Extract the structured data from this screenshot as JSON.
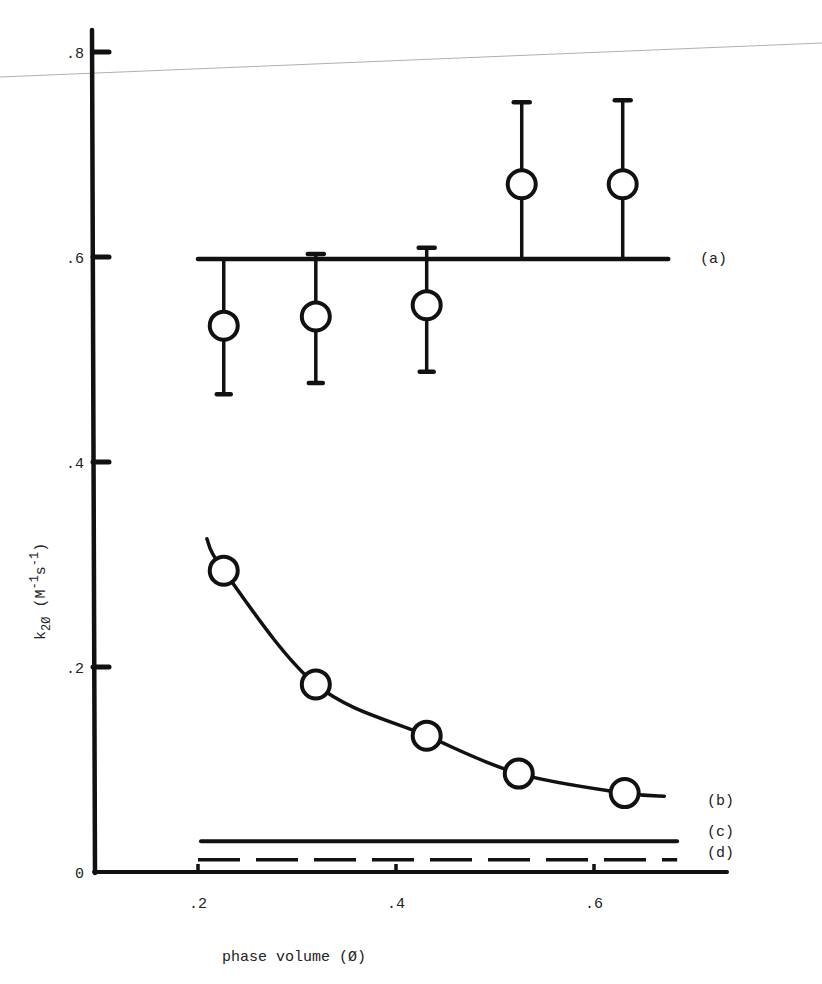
{
  "chart_data": {
    "type": "scatter",
    "title": "",
    "xlabel": "phase volume (Ø)",
    "ylabel": "k2Ø (M-1s-1)",
    "ylabel_parts": {
      "main": "k",
      "sub": "2Ø",
      "units_open": " (M",
      "sup1": "-1",
      "s": "s",
      "sup2": "-1",
      "units_close": ")"
    },
    "xlim": [
      0.1,
      0.73
    ],
    "ylim": [
      0,
      0.82
    ],
    "x_ticks": [
      0.2,
      0.4,
      0.6
    ],
    "x_tick_labels": [
      ".2",
      ".4",
      ".6"
    ],
    "y_ticks": [
      0,
      0.2,
      0.4,
      0.6,
      0.8
    ],
    "y_tick_labels": [
      "0",
      ".2",
      ".4",
      ".6",
      ".8"
    ],
    "grid": false,
    "legend_position": "right, inline labels",
    "series": [
      {
        "name": "(a)",
        "kind": "points_with_error_bars_and_horizontal_line",
        "x": [
          0.226,
          0.319,
          0.431,
          0.527,
          0.629
        ],
        "y": [
          0.533,
          0.542,
          0.553,
          0.671,
          0.671
        ],
        "y_err_upper": [
          0.598,
          0.603,
          0.609,
          0.751,
          0.753
        ],
        "y_err_lower": [
          0.466,
          0.477,
          0.488,
          0.598,
          0.598
        ],
        "upper_cap": [
          false,
          true,
          true,
          true,
          true
        ],
        "lower_cap": [
          true,
          true,
          true,
          false,
          false
        ],
        "line": {
          "y": 0.598,
          "x_start": 0.2,
          "x_end": 0.675,
          "style": "solid"
        }
      },
      {
        "name": "(b)",
        "kind": "points_with_fitted_curve",
        "x": [
          0.226,
          0.319,
          0.431,
          0.524,
          0.631
        ],
        "y": [
          0.294,
          0.183,
          0.133,
          0.096,
          0.077
        ],
        "curve": {
          "x_start": 0.209,
          "x_end": 0.671,
          "y_start": 0.325,
          "y_end": 0.074
        }
      },
      {
        "name": "(c)",
        "kind": "horizontal_line",
        "y": 0.03,
        "x_start": 0.203,
        "x_end": 0.684,
        "style": "solid"
      },
      {
        "name": "(d)",
        "kind": "horizontal_line",
        "y": 0.012,
        "x_start": 0.2,
        "x_end": 0.684,
        "style": "dashed"
      }
    ],
    "annotations": [
      "(a)",
      "(b)",
      "(c)",
      "(d)"
    ]
  },
  "colors": {
    "ink": "#111111",
    "background": "#ffffff",
    "scan_line": "#9a9a9a"
  }
}
